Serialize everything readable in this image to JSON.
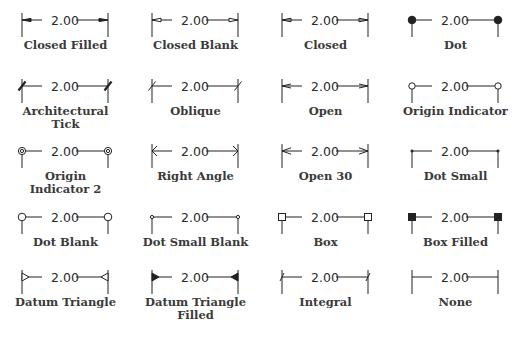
{
  "figure": {
    "dimension_value": "2.00",
    "ink_color": "#222222",
    "label_color": "#3a3a3a",
    "columns_x": [
      22,
      152,
      282,
      412
    ],
    "column_span": 86,
    "rows_y": [
      20,
      86,
      151,
      217,
      277
    ],
    "items": [
      {
        "label": "Closed Filled",
        "type": "closed-filled",
        "row": 0,
        "col": 0
      },
      {
        "label": "Closed Blank",
        "type": "closed-blank",
        "row": 0,
        "col": 1
      },
      {
        "label": "Closed",
        "type": "closed",
        "row": 0,
        "col": 2
      },
      {
        "label": "Dot",
        "type": "dot",
        "row": 0,
        "col": 3
      },
      {
        "label": "Architectural\nTick",
        "type": "architectural-tick",
        "row": 1,
        "col": 0
      },
      {
        "label": "Oblique",
        "type": "oblique",
        "row": 1,
        "col": 1
      },
      {
        "label": "Open",
        "type": "open",
        "row": 1,
        "col": 2
      },
      {
        "label": "Origin Indicator",
        "type": "origin-indicator",
        "row": 1,
        "col": 3
      },
      {
        "label": "Origin\nIndicator 2",
        "type": "origin-indicator-2",
        "row": 2,
        "col": 0
      },
      {
        "label": "Right Angle",
        "type": "right-angle",
        "row": 2,
        "col": 1
      },
      {
        "label": "Open 30",
        "type": "open-30",
        "row": 2,
        "col": 2
      },
      {
        "label": "Dot Small",
        "type": "dot-small",
        "row": 2,
        "col": 3
      },
      {
        "label": "Dot Blank",
        "type": "dot-blank",
        "row": 3,
        "col": 0
      },
      {
        "label": "Dot Small Blank",
        "type": "dot-small-blank",
        "row": 3,
        "col": 1
      },
      {
        "label": "Box",
        "type": "box",
        "row": 3,
        "col": 2
      },
      {
        "label": "Box Filled",
        "type": "box-filled",
        "row": 3,
        "col": 3
      },
      {
        "label": "Datum Triangle",
        "type": "datum-triangle",
        "row": 4,
        "col": 0
      },
      {
        "label": "Datum Triangle\nFilled",
        "type": "datum-triangle-filled",
        "row": 4,
        "col": 1
      },
      {
        "label": "Integral",
        "type": "integral",
        "row": 4,
        "col": 2
      },
      {
        "label": "None",
        "type": "none",
        "row": 4,
        "col": 3
      }
    ]
  }
}
